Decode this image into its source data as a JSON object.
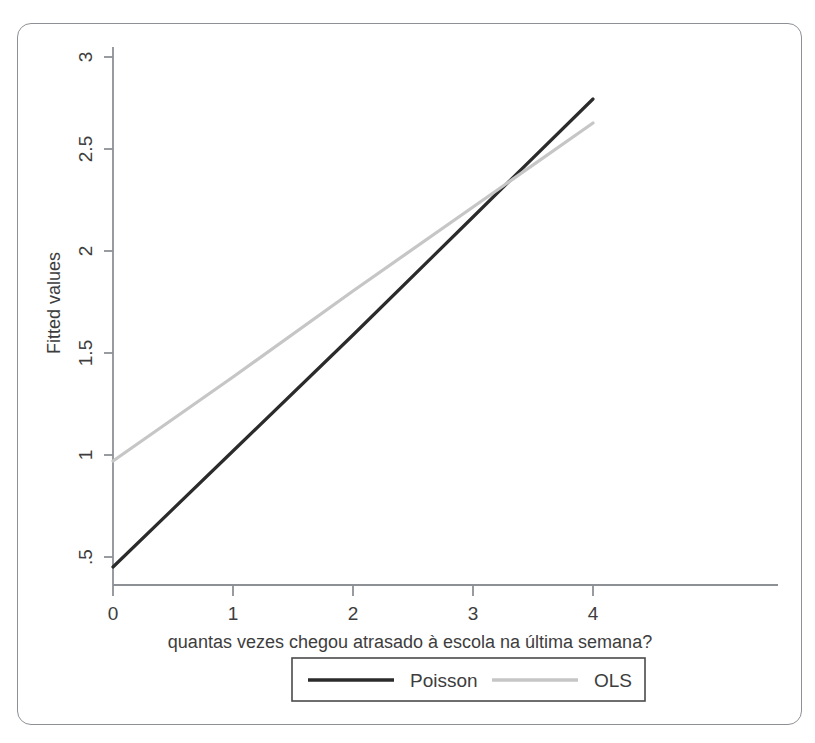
{
  "figure": {
    "background_color": "#ffffff",
    "frame_border_color": "#8d9095"
  },
  "chart_data": {
    "type": "line",
    "title": "",
    "subtitle": "",
    "xlabel": "quantas vezes chegou atrasado à escola na última semana?",
    "ylabel": "Fitted values",
    "xlim": [
      0,
      4
    ],
    "ylim": [
      0.4,
      3.1
    ],
    "xticks": [
      0,
      1,
      2,
      3,
      4
    ],
    "xticklabels": [
      "0",
      "1",
      "2",
      "3",
      "4"
    ],
    "yticks": [
      0.5,
      1,
      1.5,
      2,
      2.5,
      3
    ],
    "yticklabels": [
      ".5",
      "1",
      "1.5",
      "2",
      "2.5",
      "3"
    ],
    "grid": false,
    "legend_position": "below-axis-outside",
    "x": [
      0,
      1,
      2,
      3,
      4
    ],
    "series": [
      {
        "name": "Poisson",
        "color": "#2b2b2b",
        "linewidth": 3.2,
        "values": [
          0.45,
          1.03,
          1.61,
          2.2,
          2.79
        ]
      },
      {
        "name": "OLS",
        "color": "#c6c6c6",
        "linewidth": 3.2,
        "values": [
          0.98,
          1.4,
          1.83,
          2.25,
          2.67
        ]
      }
    ],
    "annotations": [
      {
        "text": "series cross",
        "x": 3.3,
        "y": 2.4
      }
    ]
  },
  "legend": {
    "entries": [
      {
        "label": "Poisson",
        "color": "#2b2b2b"
      },
      {
        "label": "OLS",
        "color": "#c6c6c6"
      }
    ]
  },
  "axis": {
    "x_tick_0": "0",
    "x_tick_1": "1",
    "x_tick_2": "2",
    "x_tick_3": "3",
    "x_tick_4": "4",
    "y_tick_0": ".5",
    "y_tick_1": "1",
    "y_tick_2": "1.5",
    "y_tick_3": "2",
    "y_tick_4": "2.5",
    "y_tick_5": "3",
    "x_title": "quantas vezes chegou atrasado à escola na última semana?",
    "y_title": "Fitted values"
  }
}
